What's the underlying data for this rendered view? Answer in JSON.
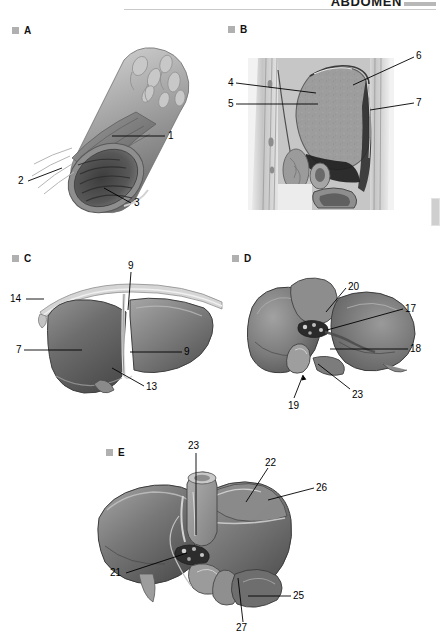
{
  "header": {
    "title": "ABDOMEN",
    "rule_color": "#c9c9c9"
  },
  "colors": {
    "ink": "#000000",
    "bullet": "#b0b0b0",
    "organ_mid": "#7d7d7d",
    "organ_dark": "#4a4a4a",
    "organ_light": "#b4b4b4",
    "bg": "#ffffff"
  },
  "panels": [
    {
      "id": "A",
      "letter": "A",
      "caption": "",
      "labels": [
        {
          "id": "A1",
          "text": "1",
          "x": 168,
          "y": 133
        },
        {
          "id": "A2",
          "text": "2",
          "x": 18,
          "y": 178
        },
        {
          "id": "A3",
          "text": "3",
          "x": 134,
          "y": 200
        }
      ]
    },
    {
      "id": "B",
      "letter": "B",
      "caption": "",
      "labels": [
        {
          "id": "B4",
          "text": "4",
          "x": 228,
          "y": 80
        },
        {
          "id": "B5",
          "text": "5",
          "x": 228,
          "y": 101
        },
        {
          "id": "B6",
          "text": "6",
          "x": 416,
          "y": 53
        },
        {
          "id": "B7",
          "text": "7",
          "x": 416,
          "y": 100
        }
      ]
    },
    {
      "id": "C",
      "letter": "C",
      "caption": "",
      "labels": [
        {
          "id": "C9a",
          "text": "9",
          "x": 128,
          "y": 263
        },
        {
          "id": "C14",
          "text": "14",
          "x": 10,
          "y": 296
        },
        {
          "id": "C7",
          "text": "7",
          "x": 16,
          "y": 347
        },
        {
          "id": "C9b",
          "text": "9",
          "x": 184,
          "y": 349
        },
        {
          "id": "C13",
          "text": "13",
          "x": 146,
          "y": 384
        }
      ]
    },
    {
      "id": "D",
      "letter": "D",
      "caption": "",
      "labels": [
        {
          "id": "D20",
          "text": "20",
          "x": 348,
          "y": 284
        },
        {
          "id": "D17",
          "text": "17",
          "x": 405,
          "y": 306
        },
        {
          "id": "D18",
          "text": "18",
          "x": 410,
          "y": 346
        },
        {
          "id": "D23",
          "text": "23",
          "x": 352,
          "y": 392
        },
        {
          "id": "D19",
          "text": "19",
          "x": 288,
          "y": 403
        }
      ]
    },
    {
      "id": "E",
      "letter": "E",
      "caption": "",
      "labels": [
        {
          "id": "E23",
          "text": "23",
          "x": 188,
          "y": 443
        },
        {
          "id": "E22",
          "text": "22",
          "x": 265,
          "y": 460
        },
        {
          "id": "E26",
          "text": "26",
          "x": 316,
          "y": 485
        },
        {
          "id": "E21",
          "text": "21",
          "x": 110,
          "y": 570
        },
        {
          "id": "E25",
          "text": "25",
          "x": 293,
          "y": 593
        },
        {
          "id": "E27",
          "text": "27",
          "x": 236,
          "y": 625
        }
      ]
    }
  ],
  "panel_letter_positions": [
    {
      "letter": "A",
      "x": 12,
      "y": 25
    },
    {
      "letter": "B",
      "x": 228,
      "y": 24
    },
    {
      "letter": "C",
      "x": 12,
      "y": 253
    },
    {
      "letter": "D",
      "x": 232,
      "y": 253
    },
    {
      "letter": "E",
      "x": 106,
      "y": 447
    }
  ]
}
